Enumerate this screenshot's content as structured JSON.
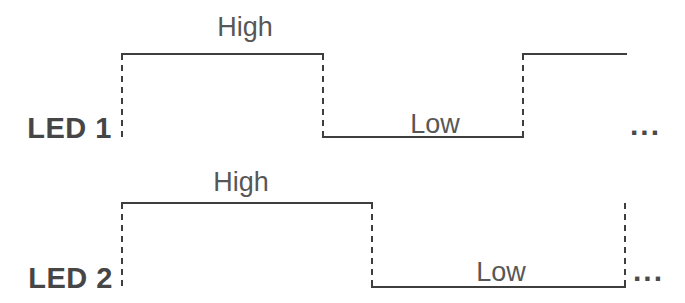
{
  "diagram": {
    "type": "timing-diagram",
    "background_color": "#ffffff",
    "line_color": "#3e3e3e",
    "signal_name_color": "#464646",
    "state_label_color": "#575757",
    "signals": [
      {
        "name": "LED 1",
        "states": [
          {
            "label": "High",
            "level": "high"
          },
          {
            "label": "Low",
            "level": "low"
          },
          {
            "label": "",
            "level": "high"
          }
        ],
        "continuation": "..."
      },
      {
        "name": "LED 2",
        "states": [
          {
            "label": "High",
            "level": "high"
          },
          {
            "label": "Low",
            "level": "low"
          }
        ],
        "continuation": "..."
      }
    ]
  }
}
